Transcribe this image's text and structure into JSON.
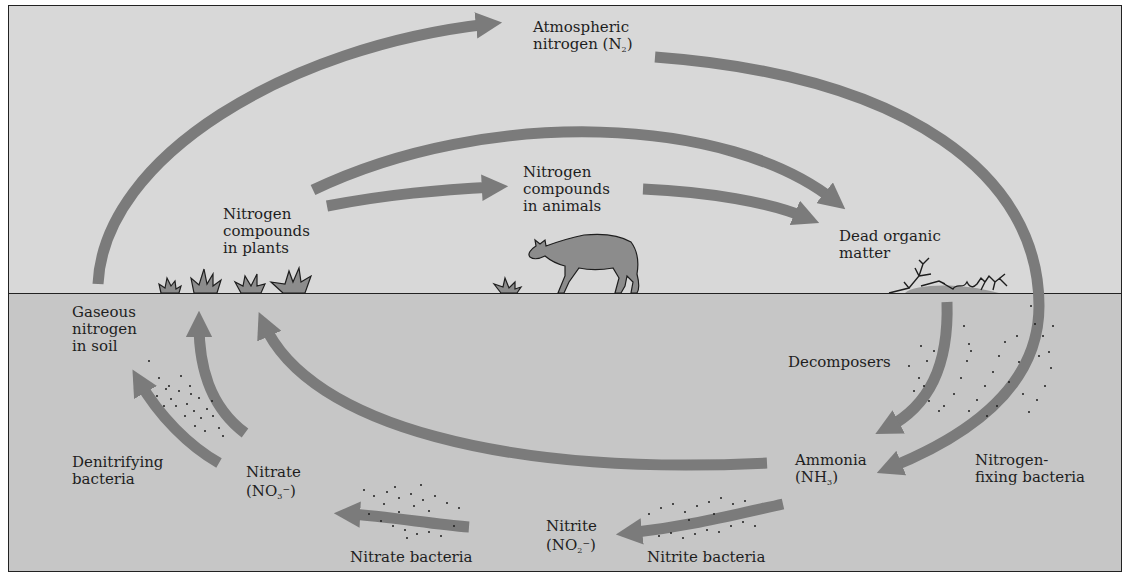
{
  "diagram": {
    "colors": {
      "sky": "#d8d8d8",
      "soil": "#c6c6c6",
      "arrow": "#7b7b7b",
      "organism_fill": "#8c8c8c",
      "outline": "#1e1e1e",
      "frame": "#222222"
    },
    "labels": {
      "atmospheric": {
        "line1": "Atmospheric",
        "line2_prefix": "nitrogen (N",
        "line2_sub": "2",
        "line2_suffix": ")"
      },
      "plants": {
        "line1": "Nitrogen",
        "line2": "compounds",
        "line3": "in plants"
      },
      "animals": {
        "line1": "Nitrogen",
        "line2": "compounds",
        "line3": "in animals"
      },
      "dead_organic": {
        "line1": "Dead organic",
        "line2": "matter"
      },
      "gaseous_soil": {
        "line1": "Gaseous",
        "line2": "nitrogen",
        "line3": "in soil"
      },
      "decomposers": {
        "line1": "Decomposers"
      },
      "denitrifying": {
        "line1": "Denitrifying",
        "line2": "bacteria"
      },
      "nitrate": {
        "line1": "Nitrate",
        "line2_prefix": "(NO",
        "line2_sub": "3",
        "line2_sup": "−",
        "line2_suffix": ")"
      },
      "ammonia": {
        "line1": "Ammonia",
        "line2_prefix": "(NH",
        "line2_sub": "3",
        "line2_suffix": ")"
      },
      "nitrogen_fixing": {
        "line1": "Nitrogen-",
        "line2": "fixing bacteria"
      },
      "nitrite": {
        "line1": "Nitrite",
        "line2_prefix": "(NO",
        "line2_sub": "2",
        "line2_sup": "−",
        "line2_suffix": ")"
      },
      "nitrate_bacteria": {
        "line1": "Nitrate bacteria"
      },
      "nitrite_bacteria": {
        "line1": "Nitrite bacteria"
      }
    },
    "nodes": [
      "Atmospheric nitrogen (N2)",
      "Nitrogen compounds in plants",
      "Nitrogen compounds in animals",
      "Dead organic matter",
      "Ammonia (NH3)",
      "Nitrite (NO2-)",
      "Nitrate (NO3-)",
      "Gaseous nitrogen in soil"
    ],
    "edges": [
      {
        "from": "Gaseous nitrogen in soil",
        "to": "Atmospheric nitrogen (N2)"
      },
      {
        "from": "Atmospheric nitrogen (N2)",
        "to": "Ammonia (NH3)",
        "via": "Nitrogen-fixing bacteria"
      },
      {
        "from": "Nitrogen compounds in plants",
        "to": "Nitrogen compounds in animals"
      },
      {
        "from": "Nitrogen compounds in animals",
        "to": "Dead organic matter"
      },
      {
        "from": "Nitrogen compounds in plants",
        "to": "Dead organic matter"
      },
      {
        "from": "Dead organic matter",
        "to": "Ammonia (NH3)",
        "via": "Decomposers"
      },
      {
        "from": "Ammonia (NH3)",
        "to": "Nitrite (NO2-)",
        "via": "Nitrite bacteria"
      },
      {
        "from": "Nitrite (NO2-)",
        "to": "Nitrate (NO3-)",
        "via": "Nitrate bacteria"
      },
      {
        "from": "Nitrate (NO3-)",
        "to": "Gaseous nitrogen in soil",
        "via": "Denitrifying bacteria"
      },
      {
        "from": "Nitrate (NO3-)",
        "to": "Nitrogen compounds in plants"
      },
      {
        "from": "Ammonia (NH3)",
        "to": "Nitrogen compounds in plants"
      }
    ],
    "icons": [
      "grass-tuft-icon",
      "cow-icon",
      "dead-branches-icon",
      "bacteria-dots-icon"
    ]
  }
}
